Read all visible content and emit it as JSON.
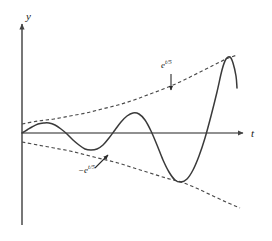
{
  "figure": {
    "background_color": "#ffffff",
    "curve_color": "#3a3a3a",
    "axis_color": "#555555",
    "envelope_color": "#4a4a4a"
  },
  "axes": {
    "y_axis_label": "y",
    "t_axis_label": "t",
    "origin_px": [
      22,
      133
    ],
    "y_axis_top_px": 22,
    "y_axis_bottom_px": 225,
    "t_axis_right_px": 245,
    "grid": false
  },
  "labels": {
    "upper_envelope": {
      "base": "e",
      "exponent": "t/5",
      "full_text": "e^(t/5)"
    },
    "lower_envelope": {
      "base": "−e",
      "exponent": "t/5",
      "full_text": "−e^(t/5)"
    }
  },
  "chart_data": {
    "type": "line",
    "title": "",
    "subtitle": "",
    "xlabel": "t",
    "ylabel": "y",
    "xlim": [
      0,
      22
    ],
    "ylim": [
      -9,
      9
    ],
    "grid": false,
    "legend": "none",
    "annotations": [
      {
        "text": "e^(t/5)",
        "target": "upper_envelope",
        "label_px": [
          161,
          61
        ],
        "arrow_from_px": [
          171,
          74
        ],
        "arrow_to_px": [
          171,
          90
        ],
        "arrow_style": "straight-down"
      },
      {
        "text": "−e^(t/5)",
        "target": "lower_envelope",
        "label_px": [
          78,
          166
        ],
        "arrow_from_px": [
          95,
          168
        ],
        "arrow_to_px": [
          108,
          155
        ],
        "arrow_style": "diagonal-up-right"
      }
    ],
    "series": [
      {
        "name": "oscillation",
        "style": "solid",
        "color": "#3a3a3a",
        "description": "e^(t/5) * sin-like oscillation with increasing amplitude",
        "points_px": [
          [
            22,
            133
          ],
          [
            27,
            130
          ],
          [
            32,
            127
          ],
          [
            38,
            124
          ],
          [
            44,
            123
          ],
          [
            49,
            123
          ],
          [
            55,
            125
          ],
          [
            61,
            129
          ],
          [
            67,
            134
          ],
          [
            73,
            140
          ],
          [
            79,
            145
          ],
          [
            85,
            149
          ],
          [
            91,
            150
          ],
          [
            97,
            149
          ],
          [
            103,
            145
          ],
          [
            109,
            138
          ],
          [
            115,
            130
          ],
          [
            121,
            122
          ],
          [
            127,
            116
          ],
          [
            133,
            113
          ],
          [
            139,
            114
          ],
          [
            145,
            120
          ],
          [
            151,
            131
          ],
          [
            157,
            145
          ],
          [
            163,
            160
          ],
          [
            169,
            172
          ],
          [
            175,
            180
          ],
          [
            181,
            182
          ],
          [
            187,
            179
          ],
          [
            193,
            170
          ],
          [
            199,
            156
          ],
          [
            205,
            138
          ],
          [
            211,
            116
          ],
          [
            217,
            92
          ],
          [
            222,
            70
          ],
          [
            226,
            59
          ],
          [
            230,
            57
          ],
          [
            233,
            63
          ],
          [
            236,
            76
          ],
          [
            237,
            88
          ]
        ]
      },
      {
        "name": "upper_envelope",
        "style": "dashed",
        "color": "#4a4a4a",
        "description": "e^(t/5) exponential growth envelope",
        "points_px": [
          [
            22,
            124
          ],
          [
            38,
            121
          ],
          [
            54,
            119
          ],
          [
            70,
            116
          ],
          [
            86,
            113
          ],
          [
            102,
            109
          ],
          [
            118,
            105
          ],
          [
            134,
            100
          ],
          [
            150,
            94
          ],
          [
            166,
            88
          ],
          [
            182,
            81
          ],
          [
            198,
            73
          ],
          [
            214,
            65
          ],
          [
            226,
            59
          ],
          [
            237,
            55
          ]
        ]
      },
      {
        "name": "lower_envelope",
        "style": "dashed",
        "color": "#4a4a4a",
        "description": "negative e^(t/5) exponential decay envelope",
        "points_px": [
          [
            22,
            142
          ],
          [
            38,
            145
          ],
          [
            54,
            148
          ],
          [
            70,
            151
          ],
          [
            86,
            155
          ],
          [
            102,
            159
          ],
          [
            118,
            163
          ],
          [
            134,
            168
          ],
          [
            150,
            173
          ],
          [
            166,
            178
          ],
          [
            181,
            182
          ],
          [
            196,
            188
          ],
          [
            211,
            195
          ],
          [
            226,
            202
          ],
          [
            240,
            208
          ]
        ]
      }
    ]
  }
}
